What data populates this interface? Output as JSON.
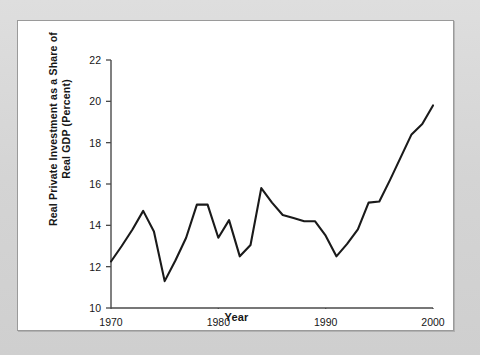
{
  "figure": {
    "panel_background": "#ffffff",
    "mat_background": "#d6d6d6",
    "line_color": "#1a1a1a",
    "axis_color": "#4a4a4a"
  },
  "chart_data": {
    "type": "line",
    "title": "",
    "xlabel": "Year",
    "ylabel": "Real Private Investment as a Share of\nReal GDP (Percent)",
    "ylabel_line1": "Real Private Investment as a Share of",
    "ylabel_line2": "Real GDP (Percent)",
    "xlim": [
      1970,
      2000
    ],
    "ylim": [
      10,
      22
    ],
    "grid": false,
    "legend": false,
    "x_ticks": [
      1970,
      1980,
      1990,
      2000
    ],
    "x_tick_labels": [
      "1970",
      "1980",
      "1990",
      "2000"
    ],
    "y_ticks": [
      10,
      12,
      14,
      16,
      18,
      20,
      22
    ],
    "y_tick_labels": [
      "10",
      "12",
      "14",
      "16",
      "18",
      "20",
      "22"
    ],
    "x": [
      1970,
      1971,
      1972,
      1973,
      1974,
      1975,
      1976,
      1977,
      1978,
      1979,
      1980,
      1981,
      1982,
      1983,
      1984,
      1985,
      1986,
      1987,
      1988,
      1989,
      1990,
      1991,
      1992,
      1993,
      1994,
      1995,
      1996,
      1997,
      1998,
      1999,
      2000
    ],
    "values": [
      12.25,
      13.0,
      13.8,
      14.7,
      13.7,
      11.3,
      12.3,
      13.4,
      15.0,
      15.0,
      13.4,
      14.25,
      12.5,
      13.05,
      15.8,
      15.1,
      14.5,
      14.35,
      14.2,
      14.2,
      13.5,
      12.5,
      13.1,
      13.8,
      15.1,
      15.15,
      16.2,
      17.3,
      18.4,
      18.9,
      19.8
    ],
    "series_name": "Real private investment share of real GDP"
  },
  "axis": {
    "x_title": "Year"
  }
}
